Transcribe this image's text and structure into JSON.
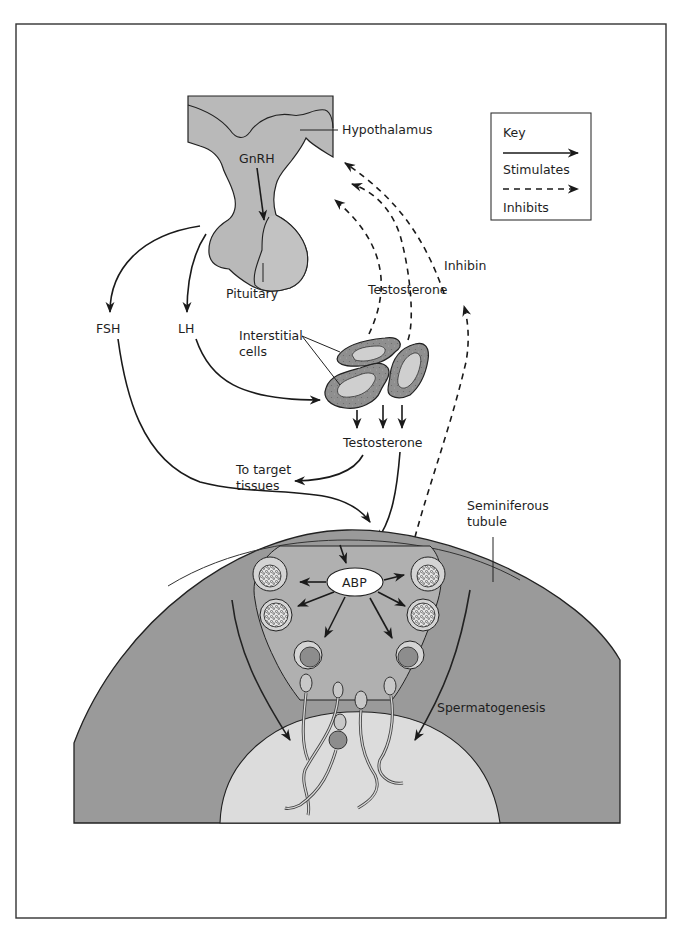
{
  "diagram": {
    "labels": {
      "hypothalamus": "Hypothalamus",
      "gnrh": "GnRH",
      "pituitary": "Pituitary",
      "fsh": "FSH",
      "lh": "LH",
      "interstitial_line1": "Interstitial",
      "interstitial_line2": "cells",
      "testosterone_upper": "Testosterone",
      "testosterone_lower": "Testosterone",
      "inhibin": "Inhibin",
      "target_line1": "To target",
      "target_line2": "tissues",
      "seminiferous_line1": "Seminiferous",
      "seminiferous_line2": "tubule",
      "abp": "ABP",
      "spermatogenesis": "Spermatogenesis"
    },
    "key": {
      "title": "Key",
      "stimulates": "Stimulates",
      "inhibits": "Inhibits"
    },
    "colors": {
      "gland_fill": "#b9b9b9",
      "tubule_fill": "#9a9a9a",
      "lumen_fill": "#dcdcdc",
      "cell_outer": "#8f8f8f",
      "cell_inner": "#cfcfcf",
      "stroke": "#1a1a1a"
    }
  }
}
